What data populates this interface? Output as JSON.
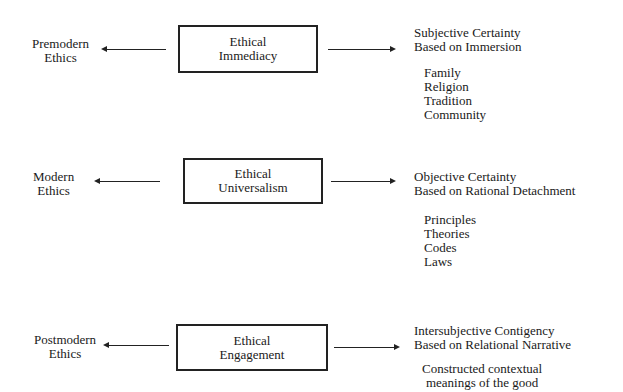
{
  "rows": [
    {
      "left_label": [
        "Premodern",
        "Ethics"
      ],
      "box_label": [
        "Ethical",
        "Immediacy"
      ],
      "right_heading": [
        "Subjective Certainty",
        "Based on Immersion"
      ],
      "right_items": [
        "Family",
        "Religion",
        "Tradition",
        "Community"
      ]
    },
    {
      "left_label": [
        "Modern",
        "Ethics"
      ],
      "box_label": [
        "Ethical",
        "Universalism"
      ],
      "right_heading": [
        "Objective Certainty",
        "Based on Rational Detachment"
      ],
      "right_items": [
        "Principles",
        "Theories",
        "Codes",
        "Laws"
      ]
    },
    {
      "left_label": [
        "Postmodern",
        "Ethics"
      ],
      "box_label": [
        "Ethical",
        "Engagement"
      ],
      "right_heading": [
        "Intersubjective Contigency",
        "Based on Relational Narrative"
      ],
      "right_items": [
        "Constructed contextual",
        "meanings of the good"
      ]
    }
  ]
}
